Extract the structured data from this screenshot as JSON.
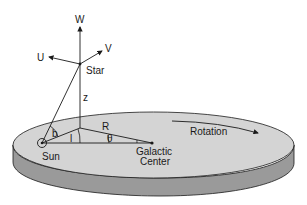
{
  "diagram": {
    "labels": {
      "W": "W",
      "U": "U",
      "V": "V",
      "star": "Star",
      "z": "z",
      "R": "R",
      "b": "b",
      "l": "l",
      "theta": "θ",
      "sun": "Sun",
      "galactic_center_line1": "Galactic",
      "galactic_center_line2": "Center",
      "rotation": "Rotation"
    },
    "colors": {
      "disk_top": "#d4d4d4",
      "disk_side": "#9a9a9a",
      "lines": "#1a1a1a",
      "background": "#ffffff"
    }
  }
}
